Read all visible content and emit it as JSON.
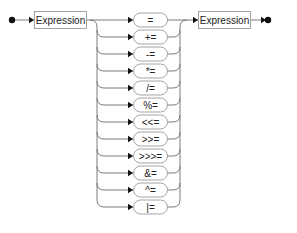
{
  "diagram": {
    "type": "railroad",
    "start_marker": "start-dot",
    "end_marker": "end-dot",
    "left_nonterminal": "Expression",
    "right_nonterminal": "Expression",
    "operators": [
      "=",
      "+=",
      "-=",
      "*=",
      "/=",
      "%=",
      "<<=",
      ">>=",
      ">>>=",
      "&=",
      "^=",
      "|="
    ],
    "colors": {
      "line": "#6e6e6e",
      "box_border": "#9a9a9a",
      "box_fill": "#ffffff",
      "text": "#222222",
      "marker": "#111111"
    }
  }
}
